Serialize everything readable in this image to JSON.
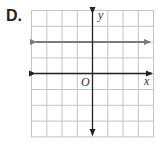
{
  "problem": {
    "label": "D."
  },
  "graph": {
    "x_axis_label": "x",
    "y_axis_label": "y",
    "origin_label": "O",
    "grid": {
      "cols": 8,
      "rows": 8
    },
    "line": {
      "description": "horizontal line y = 2",
      "y_value": 2,
      "color": "#7a7a7a"
    },
    "axis_color": "#222222",
    "grid_color": "#bdbdbd"
  }
}
